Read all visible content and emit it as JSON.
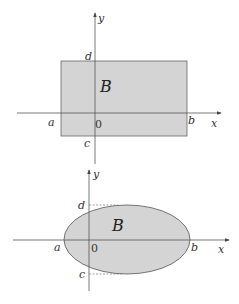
{
  "colors": {
    "region_fill": "#d4d4d4",
    "region_stroke": "#555555",
    "axis": "#555555",
    "text": "#333333"
  },
  "diagrams": [
    {
      "name": "rectangle-region",
      "region_label": "B",
      "shape": "rectangle",
      "labels": {
        "a": "a",
        "b": "b",
        "c": "c",
        "d": "d",
        "origin": "0",
        "x_axis": "x",
        "y_axis": "y"
      }
    },
    {
      "name": "ellipse-region",
      "region_label": "B",
      "shape": "ellipse",
      "labels": {
        "a": "a",
        "b": "b",
        "c": "c",
        "d": "d",
        "origin": "0",
        "x_axis": "x",
        "y_axis": "y"
      }
    }
  ]
}
